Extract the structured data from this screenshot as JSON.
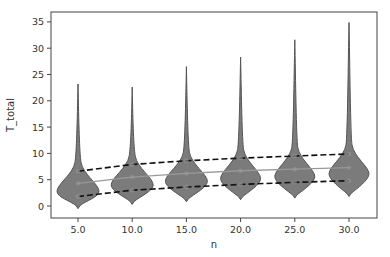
{
  "chart_data": {
    "type": "violin",
    "title": "",
    "xlabel": "n",
    "ylabel": "T_total",
    "categories": [
      "5.0",
      "10.0",
      "15.0",
      "20.0",
      "25.0",
      "30.0"
    ],
    "x": [
      5,
      10,
      15,
      20,
      25,
      30
    ],
    "ylim": [
      -2.3,
      36.8
    ],
    "yticks": [
      0,
      5,
      10,
      15,
      20,
      25,
      30,
      35
    ],
    "grid": false,
    "violins": [
      {
        "n": 5.0,
        "min": -0.5,
        "mode": 3.0,
        "max": 23.2,
        "half_width": 21
      },
      {
        "n": 10.0,
        "min": 0.3,
        "mode": 4.2,
        "max": 22.6,
        "half_width": 21
      },
      {
        "n": 15.0,
        "min": 0.8,
        "mode": 4.9,
        "max": 26.5,
        "half_width": 21
      },
      {
        "n": 20.0,
        "min": 1.2,
        "mode": 5.4,
        "max": 28.3,
        "half_width": 20
      },
      {
        "n": 25.0,
        "min": 1.5,
        "mode": 5.8,
        "max": 31.6,
        "half_width": 20
      },
      {
        "n": 30.0,
        "min": 1.8,
        "mode": 6.3,
        "max": 34.9,
        "half_width": 20
      }
    ],
    "series": [
      {
        "name": "upper",
        "style": "dashed",
        "color": "#111111",
        "values": [
          6.6,
          7.9,
          8.6,
          9.1,
          9.5,
          9.9
        ]
      },
      {
        "name": "mean",
        "style": "solid",
        "color": "#999999",
        "values": [
          4.3,
          5.5,
          6.2,
          6.7,
          7.0,
          7.3
        ]
      },
      {
        "name": "lower",
        "style": "dashed",
        "color": "#111111",
        "values": [
          1.8,
          3.0,
          3.6,
          4.1,
          4.5,
          4.8
        ]
      }
    ],
    "colors": {
      "violin_fill": "#7b7b7b",
      "violin_edge": "#555555",
      "axis": "#444444"
    }
  }
}
